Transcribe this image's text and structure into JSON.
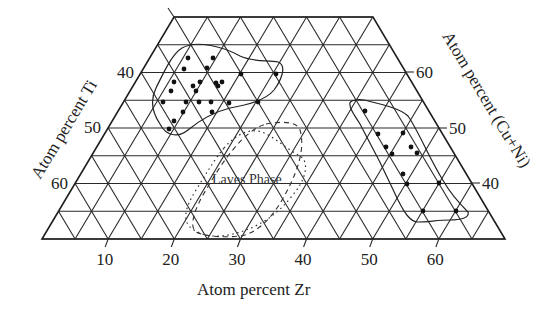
{
  "chart_data": {
    "type": "scatter",
    "subtype": "ternary",
    "title": "",
    "components": [
      "Zr",
      "Ti",
      "Cu+Ni"
    ],
    "axes": {
      "bottom": {
        "label": "Atom percent Zr",
        "ticks": [
          "10",
          "20",
          "30",
          "40",
          "50",
          "60"
        ],
        "range": [
          0,
          70
        ]
      },
      "left": {
        "label": "Atom percent Ti",
        "ticks": [
          "40",
          "50",
          "60"
        ],
        "range": [
          30,
          70
        ]
      },
      "right": {
        "label": "Atom percent (Cu+Ni)",
        "ticks": [
          "60",
          "50",
          "40"
        ],
        "range": [
          30,
          70
        ]
      }
    },
    "grid": true,
    "grid_step_percent": 5,
    "regions": [
      {
        "name": "glass-forming region (Ti-rich)",
        "style": "solid"
      },
      {
        "name": "glass-forming region (Zr-rich)",
        "style": "solid"
      },
      {
        "name": "Laves Phase",
        "label": "Laves Phase",
        "style": "dashed/dotted"
      }
    ],
    "series": [
      {
        "name": "Ti-rich cluster",
        "points_px": [
          [
            188,
            58
          ],
          [
            213,
            58
          ],
          [
            184,
            69
          ],
          [
            207,
            68
          ],
          [
            174,
            82
          ],
          [
            200,
            82
          ],
          [
            193,
            86
          ],
          [
            171,
            91
          ],
          [
            196,
            91
          ],
          [
            216,
            83
          ],
          [
            218,
            86
          ],
          [
            222,
            82
          ],
          [
            163,
            102
          ],
          [
            186,
            102
          ],
          [
            199,
            102
          ],
          [
            211,
            102
          ],
          [
            229,
            103
          ],
          [
            183,
            112
          ],
          [
            212,
            112
          ],
          [
            174,
            121
          ],
          [
            169,
            129
          ],
          [
            241,
            74
          ],
          [
            276,
            74
          ],
          [
            258,
            102
          ]
        ]
      },
      {
        "name": "Zr-rich cluster",
        "points_px": [
          [
            365,
            111
          ],
          [
            378,
            134
          ],
          [
            403,
            133
          ],
          [
            386,
            147
          ],
          [
            411,
            147
          ],
          [
            392,
            154
          ],
          [
            417,
            153
          ],
          [
            403,
            174
          ],
          [
            407,
            184
          ],
          [
            439,
            183
          ],
          [
            423,
            211
          ],
          [
            456,
            211
          ]
        ]
      }
    ]
  },
  "labels": {
    "bottom_axis_title": "Atom percent Zr",
    "left_axis_title": "Atom percent Ti",
    "right_axis_title": "Atom percent (Cu+Ni)",
    "laves_label": "Laves Phase",
    "bottom_ticks": [
      "10",
      "20",
      "30",
      "40",
      "50",
      "60"
    ],
    "left_ticks": [
      "40",
      "50",
      "60"
    ],
    "right_ticks": [
      "60",
      "50",
      "40"
    ]
  }
}
